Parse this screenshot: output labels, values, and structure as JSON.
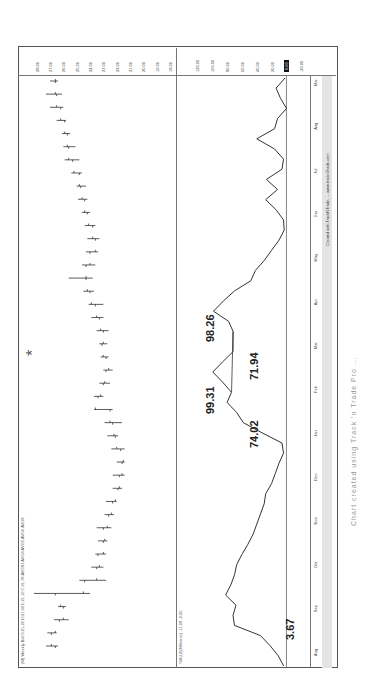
{
  "header": {
    "info_line": "(W) Weekly  Bid  O:21.22  H:21.94  L:21.10  C:21.78  AVGS3  AVG4  AVG5  AVG6  AVG8",
    "indicator_label": "%R(14)(Williams)   -11.08 -0.00"
  },
  "annotations": {
    "a1": "3.67",
    "a2": "74.02",
    "a3": "99.31",
    "a4": "71.94",
    "a5": "98.26"
  },
  "caption": "Chart created using Track 'n Trade Pro ...",
  "footer_credit": "Created with TrackNTrade, ... www.tracknTrade.com",
  "asterisk": "*",
  "chart_data": [
    {
      "type": "bar",
      "title": "Weekly OHLC price chart",
      "xlabel": "",
      "ylabel": "Price",
      "ylim": [
        18.0,
        28.5
      ],
      "y_ticks": [
        "28.00",
        "27.00",
        "26.00",
        "25.00",
        "24.00",
        "23.00",
        "22.00",
        "21.00",
        "20.00",
        "19.00",
        "18.00"
      ],
      "x_ticks": [
        "Aug",
        "Sep",
        "Oct",
        "Nov",
        "Dec",
        "Jan",
        "Feb",
        "Mar",
        "Apr",
        "May",
        "Jun",
        "Jul",
        "Aug",
        "Mar"
      ],
      "grid": false,
      "bars": [
        {
          "o": 26.6,
          "h": 27.3,
          "l": 26.4,
          "c": 26.9
        },
        {
          "o": 26.9,
          "h": 27.2,
          "l": 26.5,
          "c": 26.6
        },
        {
          "o": 26.3,
          "h": 26.7,
          "l": 25.6,
          "c": 26.0
        },
        {
          "o": 26.0,
          "h": 26.4,
          "l": 25.8,
          "c": 26.2
        },
        {
          "o": 26.6,
          "h": 28.2,
          "l": 24.0,
          "c": 24.5
        },
        {
          "o": 24.4,
          "h": 24.8,
          "l": 22.8,
          "c": 23.5
        },
        {
          "o": 23.5,
          "h": 23.9,
          "l": 23.0,
          "c": 23.3
        },
        {
          "o": 23.4,
          "h": 23.6,
          "l": 22.8,
          "c": 23.0
        },
        {
          "o": 23.0,
          "h": 23.4,
          "l": 22.7,
          "c": 22.9
        },
        {
          "o": 23.0,
          "h": 23.5,
          "l": 22.4,
          "c": 22.7
        },
        {
          "o": 22.6,
          "h": 22.9,
          "l": 22.2,
          "c": 22.4
        },
        {
          "o": 22.3,
          "h": 22.8,
          "l": 22.0,
          "c": 22.1
        },
        {
          "o": 21.9,
          "h": 22.3,
          "l": 21.6,
          "c": 21.8
        },
        {
          "o": 21.8,
          "h": 22.3,
          "l": 21.4,
          "c": 21.6
        },
        {
          "o": 21.6,
          "h": 22.0,
          "l": 21.4,
          "c": 21.5
        },
        {
          "o": 21.7,
          "h": 22.4,
          "l": 21.4,
          "c": 22.0
        },
        {
          "o": 22.1,
          "h": 22.7,
          "l": 21.9,
          "c": 22.2
        },
        {
          "o": 22.3,
          "h": 22.9,
          "l": 21.6,
          "c": 22.5
        },
        {
          "o": 22.5,
          "h": 23.7,
          "l": 22.3,
          "c": 23.6
        },
        {
          "o": 23.4,
          "h": 23.7,
          "l": 23.0,
          "c": 23.2
        },
        {
          "o": 23.0,
          "h": 23.3,
          "l": 22.5,
          "c": 22.9
        },
        {
          "o": 22.8,
          "h": 23.0,
          "l": 22.3,
          "c": 22.6
        },
        {
          "o": 22.8,
          "h": 23.2,
          "l": 22.6,
          "c": 23.0
        },
        {
          "o": 23.1,
          "h": 23.3,
          "l": 22.7,
          "c": 23.0
        },
        {
          "o": 23.0,
          "h": 23.5,
          "l": 22.6,
          "c": 23.2
        },
        {
          "o": 23.3,
          "h": 23.9,
          "l": 23.0,
          "c": 23.5
        },
        {
          "o": 23.6,
          "h": 24.1,
          "l": 23.0,
          "c": 23.9
        },
        {
          "o": 24.0,
          "h": 24.5,
          "l": 23.7,
          "c": 24.2
        },
        {
          "o": 24.3,
          "h": 25.6,
          "l": 23.8,
          "c": 24.3
        },
        {
          "o": 24.3,
          "h": 24.6,
          "l": 23.6,
          "c": 24.0
        },
        {
          "o": 24.0,
          "h": 24.3,
          "l": 23.4,
          "c": 23.6
        },
        {
          "o": 23.6,
          "h": 24.2,
          "l": 23.3,
          "c": 23.8
        },
        {
          "o": 23.8,
          "h": 24.4,
          "l": 23.6,
          "c": 24.1
        },
        {
          "o": 24.2,
          "h": 24.6,
          "l": 24.0,
          "c": 24.4
        },
        {
          "o": 24.4,
          "h": 24.9,
          "l": 24.2,
          "c": 24.6
        },
        {
          "o": 24.7,
          "h": 25.0,
          "l": 24.3,
          "c": 24.8
        },
        {
          "o": 24.8,
          "h": 25.4,
          "l": 24.6,
          "c": 25.2
        },
        {
          "o": 25.3,
          "h": 25.9,
          "l": 24.8,
          "c": 25.6
        },
        {
          "o": 25.6,
          "h": 26.0,
          "l": 25.1,
          "c": 25.7
        },
        {
          "o": 25.7,
          "h": 26.1,
          "l": 25.5,
          "c": 25.9
        },
        {
          "o": 25.9,
          "h": 26.5,
          "l": 25.8,
          "c": 26.2
        },
        {
          "o": 26.2,
          "h": 27.0,
          "l": 26.0,
          "c": 26.5
        },
        {
          "o": 26.5,
          "h": 27.3,
          "l": 26.1,
          "c": 26.6
        },
        {
          "o": 26.6,
          "h": 27.0,
          "l": 26.4,
          "c": 26.6
        }
      ]
    },
    {
      "type": "line",
      "title": "%R(14) Williams oscillator",
      "ylabel": "%R",
      "ylim": [
        -25,
        130
      ],
      "y_ticks": [
        "120.00",
        "100.00",
        "80.00",
        "60.00",
        "40.00",
        "20.00",
        "0.00",
        "-20.00"
      ],
      "highlighted_tick": "0.00",
      "series": [
        {
          "name": "%R(14)",
          "values": [
            3.7,
            11,
            22,
            35,
            70,
            72,
            68,
            82,
            75,
            70,
            67,
            60,
            52,
            45,
            40,
            35,
            30,
            28,
            20,
            15,
            10,
            4,
            6,
            33,
            58,
            67,
            80,
            74,
            86,
            99.3,
            86,
            72,
            72,
            71.9,
            78,
            98.3,
            85,
            70,
            48,
            42,
            30,
            20,
            10,
            3,
            4,
            14,
            28,
            12,
            27,
            6,
            4,
            16,
            40,
            16,
            12,
            0,
            8,
            14,
            2
          ]
        }
      ],
      "annotations": [
        {
          "label": "3.67",
          "value": 3.67
        },
        {
          "label": "74.02",
          "value": 74.02
        },
        {
          "label": "99.31",
          "value": 99.31
        },
        {
          "label": "71.94",
          "value": 71.94
        },
        {
          "label": "98.26",
          "value": 98.26
        }
      ]
    }
  ]
}
